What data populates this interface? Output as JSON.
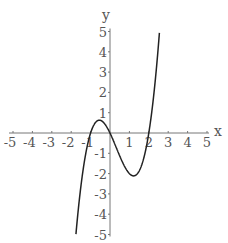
{
  "chart_data": {
    "type": "line",
    "title": "",
    "xlabel": "x",
    "ylabel": "y",
    "xlim": [
      -5,
      5
    ],
    "ylim": [
      -5,
      5
    ],
    "grid": false,
    "legend": null,
    "x_ticks": [
      -5,
      -4,
      -3,
      -2,
      -1,
      1,
      2,
      3,
      4,
      5
    ],
    "y_ticks": [
      -5,
      -4,
      -3,
      -2,
      -1,
      1,
      2,
      3,
      4,
      5
    ],
    "series": [
      {
        "name": "f(x) = x^3 - x^2 - 2x",
        "function": "x^3 - x^2 - 2*x",
        "roots": [
          -1,
          0,
          2
        ],
        "local_max": [
          -0.55,
          0.63
        ],
        "local_min": [
          1.22,
          -2.11
        ],
        "x": [
          -1.75,
          -1.5,
          -1.25,
          -1.0,
          -0.75,
          -0.55,
          -0.25,
          0.0,
          0.25,
          0.5,
          0.75,
          1.0,
          1.22,
          1.5,
          1.75,
          2.0,
          2.25,
          2.5,
          2.57
        ],
        "y": [
          -4.92,
          -2.63,
          -0.98,
          0.0,
          0.42,
          0.63,
          0.42,
          0.0,
          -0.55,
          -1.13,
          -1.64,
          -2.0,
          -2.11,
          -1.88,
          -1.08,
          0.0,
          1.83,
          4.38,
          4.99
        ]
      }
    ],
    "colors": {
      "curve": "#222222",
      "axes": "#777777",
      "labels": "#555555"
    }
  }
}
